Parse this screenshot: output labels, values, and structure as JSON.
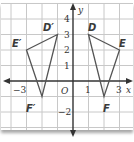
{
  "diagram": {
    "type": "coordinate-plane-reflection",
    "axes": {
      "x_label": "x",
      "y_label": "y",
      "origin_label": "O",
      "x_ticks": [
        {
          "value": -3,
          "label": "−3"
        },
        {
          "value": 1,
          "label": "1"
        },
        {
          "value": 3,
          "label": "3"
        }
      ],
      "y_ticks": [
        {
          "value": 4,
          "label": "4"
        },
        {
          "value": 3,
          "label": "3"
        },
        {
          "value": 2,
          "label": "2"
        },
        {
          "value": 1,
          "label": "1"
        },
        {
          "value": -2,
          "label": "−2"
        }
      ],
      "x_range": [
        -4,
        4
      ],
      "y_range": [
        -3,
        5
      ]
    },
    "triangles": [
      {
        "name": "DEF",
        "vertices": [
          {
            "label": "D",
            "x": 1,
            "y": 3
          },
          {
            "label": "E",
            "x": 3,
            "y": 2
          },
          {
            "label": "F",
            "x": 2,
            "y": -1
          }
        ]
      },
      {
        "name": "D'E'F'",
        "vertices": [
          {
            "label": "D′",
            "x": -1,
            "y": 3
          },
          {
            "label": "E′",
            "x": -3,
            "y": 2
          },
          {
            "label": "F′",
            "x": -2,
            "y": -1
          }
        ]
      }
    ],
    "colors": {
      "grid": "#c8c8c8",
      "axis": "#333333",
      "triangle_stroke": "#555555"
    }
  }
}
